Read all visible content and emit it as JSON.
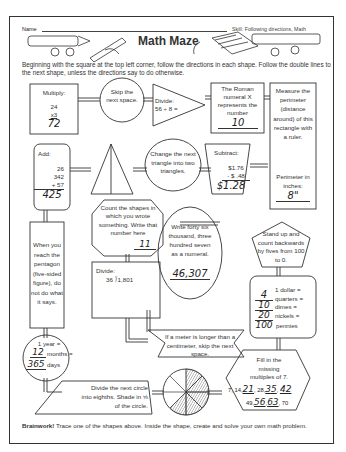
{
  "header": {
    "name_label": "Name",
    "skill": "Skill: Following directions, Math",
    "title": "Math Maze"
  },
  "instructions": "Beginning with the square at the top left corner, follow the directions in each shape. Follow the double lines to the next shape, unless the directions say to do otherwise.",
  "shapes": {
    "multiply": {
      "label": "Multiply:",
      "a": "24",
      "b": "x3",
      "answer": "72"
    },
    "skip": {
      "text": "Skip the next space."
    },
    "divide1": {
      "label": "Divide:",
      "expr": "56 ÷ 8 ="
    },
    "roman": {
      "text": "The Roman numeral X represents the number",
      "answer": "10"
    },
    "measure": {
      "text": "Measure the perimeter (distance around) of this rectangle with a ruler.",
      "sub": "Perimeter in inches:",
      "answer": "8\""
    },
    "add": {
      "label": "Add:",
      "a": "26",
      "b": "342",
      "c": "+ 57",
      "answer": "425"
    },
    "change_triangle": {
      "text": "Change the next triangle into two triangles."
    },
    "subtract": {
      "label": "Subtract:",
      "a": "$1.76",
      "b": "- $ .48",
      "answer": "$1.28"
    },
    "count": {
      "text": "Count the shapes in which you wrote something. Write that number here",
      "answer": "11"
    },
    "pentagon_note": {
      "text": "When you reach the pentagon (five-sided figure), do not do what it says."
    },
    "write": {
      "text": "Write forty six thousand, three hundred seven as a numeral.",
      "answer": "46,307"
    },
    "stand_up": {
      "text": "Stand up and count backwards by fives from 100 to 0."
    },
    "divide2": {
      "label": "Divide:",
      "expr": "36 ⟌1,801"
    },
    "money": {
      "line1": "1 dollar =",
      "q": "4",
      "q_label": "quarters =",
      "d": "10",
      "d_label": "dimes =",
      "n": "20",
      "n_label": "nickels =",
      "p": "100",
      "p_label": "pennies"
    },
    "meter": {
      "text": "If a meter is longer than a centimeter, skip the next space."
    },
    "year": {
      "line1": "1 year =",
      "months": "12",
      "months_label": "months =",
      "days": "365",
      "days_label": "days"
    },
    "eighths": {
      "text": "Divide the next circle into eighths. Shade in ⅝ of the circle."
    },
    "multiples": {
      "text": "Fill in the missing multiples of 7.",
      "seq1": [
        "7,",
        "14,",
        "21",
        ", 28,",
        "35",
        ",",
        "42",
        ","
      ],
      "seq2": [
        "49,",
        "56",
        ",",
        "63",
        ", 70"
      ]
    }
  },
  "brainwork": {
    "label": "Brainwork!",
    "text": " Trace one of the shapes above. Inside the shape, create and solve your own math problem."
  }
}
